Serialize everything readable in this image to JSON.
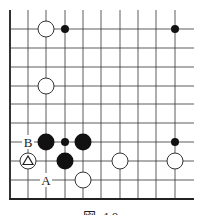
{
  "figure": {
    "type": "go-board-diagram",
    "caption": "図 10",
    "grid": {
      "x_lines": [
        10,
        28,
        46,
        65,
        83,
        101,
        120,
        138,
        156,
        175
      ],
      "y_lines": [
        29,
        48,
        67,
        86,
        104,
        123,
        142,
        161,
        180
      ],
      "left_edge_x": 10,
      "bottom_edge_y": 199,
      "right_extent_x": 194,
      "top_extent_y": 10
    },
    "stones": [
      {
        "color": "white",
        "x": 46,
        "y": 29,
        "size": "large"
      },
      {
        "color": "black",
        "x": 65,
        "y": 29,
        "size": "small"
      },
      {
        "color": "black",
        "x": 175,
        "y": 29,
        "size": "small"
      },
      {
        "color": "white",
        "x": 46,
        "y": 86,
        "size": "large"
      },
      {
        "color": "black",
        "x": 46,
        "y": 142,
        "size": "large"
      },
      {
        "color": "black",
        "x": 65,
        "y": 142,
        "size": "small"
      },
      {
        "color": "black",
        "x": 83,
        "y": 142,
        "size": "large"
      },
      {
        "color": "black",
        "x": 175,
        "y": 142,
        "size": "small"
      },
      {
        "color": "white",
        "x": 28,
        "y": 161,
        "size": "large",
        "marker": "triangle"
      },
      {
        "color": "black",
        "x": 65,
        "y": 161,
        "size": "large"
      },
      {
        "color": "white",
        "x": 120,
        "y": 161,
        "size": "large"
      },
      {
        "color": "white",
        "x": 175,
        "y": 161,
        "size": "large"
      },
      {
        "color": "white",
        "x": 83,
        "y": 180,
        "size": "large"
      }
    ],
    "labels": [
      {
        "text": "B",
        "x": 28,
        "y": 142
      },
      {
        "text": "A",
        "x": 46,
        "y": 180
      }
    ]
  }
}
